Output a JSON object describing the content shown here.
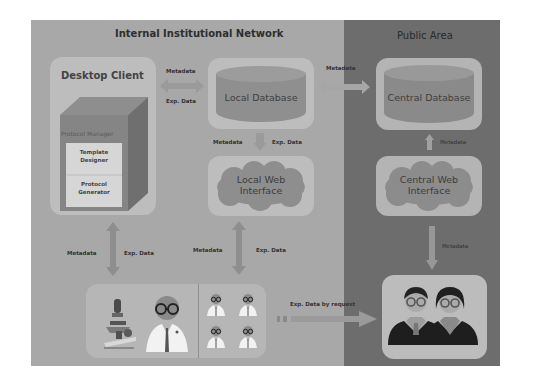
{
  "regions": {
    "internal": {
      "title": "Internal Institutional Network",
      "color": "#a8a8a8"
    },
    "public": {
      "title": "Public Area",
      "color": "#6d6d6d"
    }
  },
  "desktop_client": {
    "title": "Desktop Client",
    "cube_label": "Protocol Manager",
    "modules": [
      "Template Designer",
      "Protocol Generator"
    ],
    "module_lines": [
      [
        "Template",
        "Designer"
      ],
      [
        "Protocol",
        "Generator"
      ]
    ]
  },
  "local_database": {
    "label": "Local Database"
  },
  "central_database": {
    "label": "Central Database"
  },
  "local_web_interface": {
    "line1": "Local Web",
    "line2": "Interface"
  },
  "central_web_interface": {
    "line1": "Central Web",
    "line2": "Interface"
  },
  "arrows": {
    "client_localdb": {
      "top": "Metadata",
      "bottom": "Exp. Data"
    },
    "localdb_centraldb": {
      "top": "Metadata"
    },
    "localdb_localweb": {
      "left": "Metadata",
      "right": "Exp. Data"
    },
    "centraldb_centralweb": {
      "right": "Metadata"
    },
    "client_researchers": {
      "left": "Metadata",
      "right": "Exp. Data"
    },
    "localweb_researchers": {
      "left": "Metadata",
      "right": "Exp. Data"
    },
    "centralweb_public": {
      "right": "Metadata"
    },
    "researchers_public": {
      "top": "Exp. Data by request"
    }
  },
  "actors": {
    "lab": [
      "microscope-icon",
      "scientist-icon"
    ],
    "team": [
      "scientist-small-icon",
      "scientist-small-icon",
      "scientist-small-icon",
      "scientist-small-icon"
    ],
    "public": [
      "man-user-icon",
      "woman-user-icon"
    ]
  }
}
